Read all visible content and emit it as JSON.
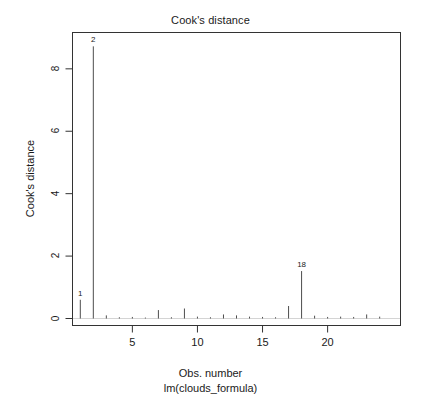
{
  "chart_data": {
    "type": "bar",
    "title": "Cook's distance",
    "xlabel": "Obs. number",
    "sublabel": "lm(clouds_formula)",
    "ylabel": "Cook's distance",
    "xlim": [
      0.4,
      25.6
    ],
    "ylim": [
      0,
      9.1
    ],
    "xticks": [
      5,
      10,
      15,
      20
    ],
    "xtick_labels": [
      "5",
      "10",
      "15",
      "20"
    ],
    "yticks": [
      0,
      2,
      4,
      6,
      8
    ],
    "ytick_labels": [
      "0",
      "2",
      "4",
      "6",
      "8"
    ],
    "grid": false,
    "legend": false,
    "x": [
      1,
      2,
      3,
      4,
      5,
      6,
      7,
      8,
      9,
      10,
      11,
      12,
      13,
      14,
      15,
      16,
      17,
      18,
      19,
      20,
      21,
      22,
      23,
      24
    ],
    "values": [
      0.6,
      8.72,
      0.1,
      0.04,
      0.05,
      0.03,
      0.27,
      0.04,
      0.32,
      0.06,
      0.04,
      0.13,
      0.1,
      0.06,
      0.05,
      0.04,
      0.4,
      1.52,
      0.09,
      0.05,
      0.06,
      0.05,
      0.13,
      0.06
    ],
    "annotations": [
      {
        "label": "1",
        "x": 1,
        "y": 0.6
      },
      {
        "label": "2",
        "x": 2,
        "y": 8.72
      },
      {
        "label": "18",
        "x": 18,
        "y": 1.52
      }
    ],
    "line_color": "#4d4d4d",
    "axis_color": "#333333",
    "background": "#ffffff"
  }
}
